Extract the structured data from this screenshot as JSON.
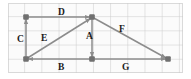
{
  "diagram": {
    "background_color": "#fbfbfb",
    "grid_color": "#cdcdcd",
    "stroke_color": "#8c8c8c",
    "node_color": "#707070",
    "label_color": "#1a1a1a",
    "points": {
      "top_left": {
        "x": 26,
        "y": 17
      },
      "apex": {
        "x": 92,
        "y": 17
      },
      "bottom_left": {
        "x": 26,
        "y": 59
      },
      "bottom_middle": {
        "x": 92,
        "y": 59
      },
      "bottom_right": {
        "x": 168,
        "y": 59
      }
    },
    "vectors": [
      {
        "label": "A",
        "from": "apex",
        "to": "bottom_middle",
        "label_x": 86,
        "label_y": 31
      },
      {
        "label": "B",
        "from": "bottom_middle",
        "to": "bottom_left",
        "label_x": 58,
        "label_y": 62
      },
      {
        "label": "C",
        "from": "bottom_left",
        "to": "top_left",
        "label_x": 17,
        "label_y": 34
      },
      {
        "label": "D",
        "from": "top_left",
        "to": "apex",
        "label_x": 58,
        "label_y": 7
      },
      {
        "label": "E",
        "from": "bottom_left",
        "to": "apex",
        "label_x": 41,
        "label_y": 33
      },
      {
        "label": "F",
        "from": "apex",
        "to": "bottom_right",
        "label_x": 119,
        "label_y": 24
      },
      {
        "label": "G",
        "from": "bottom_middle",
        "to": "bottom_right",
        "label_x": 122,
        "label_y": 62
      }
    ],
    "nodes": [
      {
        "name": "node-top-left",
        "x": 26,
        "y": 17
      },
      {
        "name": "node-apex",
        "x": 92,
        "y": 17
      },
      {
        "name": "node-bottom-left",
        "x": 26,
        "y": 59
      },
      {
        "name": "node-bottom-middle",
        "x": 92,
        "y": 59
      },
      {
        "name": "node-bottom-right",
        "x": 168,
        "y": 59
      }
    ]
  }
}
